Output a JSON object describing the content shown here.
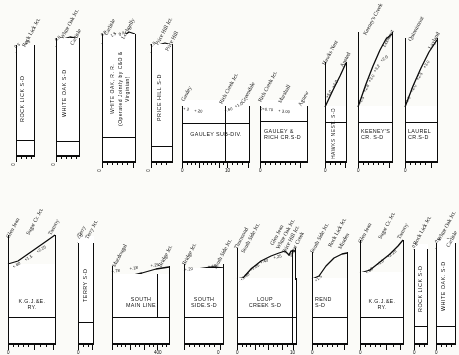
{
  "document": {
    "type": "railroad-grade-profile-sheet",
    "ink_color": "#111111",
    "paper_color": "#fbfbf8",
    "scale_marker": "400"
  },
  "panels": [
    {
      "id": "rock-lick-sd-top",
      "title": "ROCK LICK S-D",
      "title_orientation": "vertical",
      "row": "top",
      "stations": [
        "Rock Lick Jct."
      ],
      "grades": [
        "0.5",
        ".25"
      ],
      "scale_labels": [
        "0"
      ],
      "scale_miles": 1
    },
    {
      "id": "white-oak-sd-top",
      "title": "WHITE OAK  S-D",
      "title_orientation": "vertical",
      "row": "top",
      "stations": [
        "White Oak Jct.",
        "Carlisle"
      ],
      "grades": [
        "0.8"
      ],
      "scale_labels": [
        "0"
      ],
      "scale_miles": 2
    },
    {
      "id": "white-oak-rr",
      "title": "WHITE  OAK,  R. R.\n(Operated Jointly by C&O & Virginian)",
      "title_orientation": "vertical",
      "row": "top",
      "stations": [
        "Carlisle",
        "Lochgelly"
      ],
      "grades": [
        "0.8",
        "1.5",
        "0.4"
      ],
      "scale_labels": [
        "0"
      ],
      "scale_miles": 5
    },
    {
      "id": "price-hill-sd",
      "title": "PRICE HILL  S-D",
      "title_orientation": "vertical",
      "row": "top",
      "stations": [
        "Price Hill Jct.",
        "Price Hill"
      ],
      "grades": [
        "1.0"
      ],
      "scale_labels": [
        "0"
      ],
      "scale_miles": 2
    },
    {
      "id": "gauley-sub-div",
      "title": "GAULEY  SUB-DIV.",
      "title_orientation": "horizontal",
      "row": "top",
      "stations": [
        "Gauley",
        "Rich Creek Jct.",
        "Greendale"
      ],
      "grades": [
        "+.2",
        "+.20",
        "+.60",
        "+1.0"
      ],
      "scale_labels": [
        "0",
        "10"
      ],
      "scale_miles": 14
    },
    {
      "id": "gauley-rich-cr-sd",
      "title": "GAULEY &\nRICH CR.S-D",
      "title_orientation": "horizontal",
      "row": "top",
      "stations": [
        "Rich Creek Jct.",
        "Marshall",
        "Agnew"
      ],
      "grades": [
        "0+0.70",
        "+ 3.00"
      ],
      "scale_labels": [
        "0"
      ],
      "scale_miles": 8
    },
    {
      "id": "hawks-nest-sd",
      "title": "HAWKS NEST. S-D",
      "title_orientation": "vertical",
      "row": "top",
      "stations": [
        "Hawks Nest",
        "Ansted"
      ],
      "grades": [
        "+5.0",
        "+4.0"
      ],
      "scale_labels": [
        "0"
      ],
      "scale_miles": 3
    },
    {
      "id": "keeneys-cr-sd",
      "title": "KEENEY'S\nCR. S-D",
      "title_orientation": "horizontal",
      "row": "top",
      "stations": [
        "Keeney's Creek",
        "Lookout"
      ],
      "grades": [
        "+1.5",
        "+2.8",
        "+3.0",
        "+3.2",
        "+2.0"
      ],
      "scale_labels": [
        "0"
      ],
      "scale_miles": 7
    },
    {
      "id": "laurel-cr-sd",
      "title": "LAUREL\nCR.S-D",
      "title_orientation": "horizontal",
      "row": "top",
      "stations": [
        "Quinnimont",
        "Layland"
      ],
      "grades": [
        "+1.0",
        "+2.0",
        "+2.5",
        "+3.0"
      ],
      "scale_labels": [
        "0"
      ],
      "scale_miles": 6
    },
    {
      "id": "kgj-e-ry-left",
      "title": "K.G.J.&E.\nRY.",
      "title_orientation": "horizontal",
      "row": "bottom",
      "stations": [
        "Glen Jean",
        "Sugar Cr. Jct.",
        "Tamroy"
      ],
      "grades": [
        "+.80",
        "+1.5",
        "+2.25"
      ],
      "scale_labels": [
        "0"
      ],
      "scale_miles": 7
    },
    {
      "id": "terry-sd",
      "title": "TERRY  S-D",
      "title_orientation": "vertical",
      "row": "bottom",
      "stations": [
        "Terry",
        "Terry Jct."
      ],
      "grades": [
        "1.0"
      ],
      "scale_labels": [
        "0"
      ],
      "scale_miles": 2
    },
    {
      "id": "south-main-line",
      "title": "SOUTH\nMAIN LINE",
      "title_orientation": "horizontal",
      "row": "bottom",
      "stations": [
        "Macdougal",
        "Bridge Jct."
      ],
      "grades": [
        "+.78",
        "+.18",
        "+.25"
      ],
      "scale_labels": [
        "400"
      ],
      "scale_miles": 10
    },
    {
      "id": "south-side-sd",
      "title": "SOUTH\nSIDE.S-D",
      "title_orientation": "horizontal",
      "row": "bottom",
      "stations": [
        "Bridge Jct.",
        "South Side Jct."
      ],
      "grades": [
        "+.20",
        "+.18"
      ],
      "scale_labels": [
        "0"
      ],
      "scale_miles": 6
    },
    {
      "id": "loup-creek-sd",
      "title": "LOUP\nCREEK S-D",
      "title_orientation": "horizontal",
      "row": "bottom",
      "stations": [
        "Thurmond",
        "South Side Jct.",
        "Glen Jean",
        "White Oak Jct.",
        "Price Hill Jct.",
        "Sugar Creek"
      ],
      "grades": [
        "+1.30",
        "+1.05",
        "+.40",
        "+.25"
      ],
      "scale_labels": [
        "0",
        "10"
      ],
      "scale_miles": 14
    },
    {
      "id": "rend-sd",
      "title": "REND\nS-D",
      "title_orientation": "horizontal",
      "row": "bottom",
      "stations": [
        "South Side Jct.",
        "Rock Lick Jct.",
        "Minden"
      ],
      "grades": [
        "+1.5"
      ],
      "scale_labels": [
        "0"
      ],
      "scale_miles": 6
    },
    {
      "id": "kgj-e-ry-right",
      "title": "K.G.J.&E.\nRY.",
      "title_orientation": "horizontal",
      "row": "bottom",
      "stations": [
        "Glen Jean",
        "Sugar Cr. Jct.",
        "Tamroy"
      ],
      "grades": [
        "+.80",
        "+1.5",
        "+2.25"
      ],
      "scale_labels": [
        "0"
      ],
      "scale_miles": 7
    },
    {
      "id": "rock-lick-sd-bottom",
      "title": "ROCK  LICK  S-D",
      "title_orientation": "vertical",
      "row": "bottom",
      "stations": [
        "Rock Lick Jct."
      ],
      "grades": [
        "0.5"
      ],
      "scale_labels": [
        "0"
      ],
      "scale_miles": 2
    },
    {
      "id": "white-oak-sd-bottom",
      "title": "WHITE  OAK.  S-D",
      "title_orientation": "vertical",
      "row": "bottom",
      "stations": [
        "White Oak Jct.",
        "Carlisle"
      ],
      "grades": [
        "0.8"
      ],
      "scale_labels": [
        "0"
      ],
      "scale_miles": 3
    }
  ]
}
